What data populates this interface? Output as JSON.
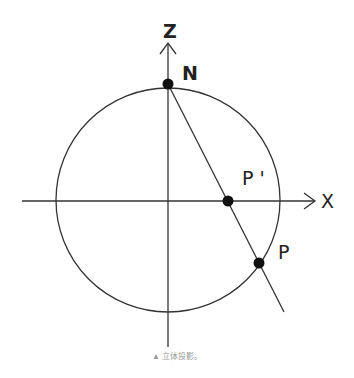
{
  "diagram": {
    "type": "stereographic-projection",
    "axes": {
      "z_label": "Z",
      "x_label": "X"
    },
    "points": [
      {
        "id": "N",
        "label": "N",
        "x": 168,
        "y": 84
      },
      {
        "id": "Pprime",
        "label": "P '",
        "x": 228,
        "y": 201
      },
      {
        "id": "P",
        "label": "P",
        "x": 259,
        "y": 263
      }
    ],
    "circle": {
      "cx": 168,
      "cy": 200,
      "r": 112
    },
    "colors": {
      "stroke": "#333333",
      "point": "#111111"
    }
  },
  "caption": "▲ 立体投影。"
}
